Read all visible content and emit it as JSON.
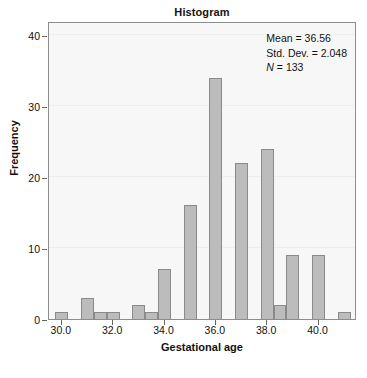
{
  "chart_data": {
    "type": "bar",
    "title": "Histogram",
    "xlabel": "Gestational age",
    "ylabel": "Frequency",
    "xlim": [
      29.5,
      41.5
    ],
    "ylim": [
      0,
      42
    ],
    "bin_width": 0.5,
    "grid": false,
    "legend": "none",
    "x_ticks": [
      "30.0",
      "32.0",
      "34.0",
      "36.0",
      "38.0",
      "40.0"
    ],
    "x_tick_values": [
      30.0,
      32.0,
      34.0,
      36.0,
      38.0,
      40.0
    ],
    "y_ticks": [
      "0",
      "10",
      "20",
      "30",
      "40"
    ],
    "y_tick_values": [
      0,
      10,
      20,
      30,
      40
    ],
    "bins": [
      {
        "center": 30.0,
        "left": 29.75,
        "right": 30.25,
        "value": 1
      },
      {
        "center": 30.5,
        "left": 30.25,
        "right": 30.75,
        "value": 0
      },
      {
        "center": 31.0,
        "left": 30.75,
        "right": 31.25,
        "value": 3
      },
      {
        "center": 31.5,
        "left": 31.25,
        "right": 31.75,
        "value": 1
      },
      {
        "center": 32.0,
        "left": 31.75,
        "right": 32.25,
        "value": 1
      },
      {
        "center": 32.5,
        "left": 32.25,
        "right": 32.75,
        "value": 0
      },
      {
        "center": 33.0,
        "left": 32.75,
        "right": 33.25,
        "value": 2
      },
      {
        "center": 33.5,
        "left": 33.25,
        "right": 33.75,
        "value": 1
      },
      {
        "center": 34.0,
        "left": 33.75,
        "right": 34.25,
        "value": 7
      },
      {
        "center": 34.5,
        "left": 34.25,
        "right": 34.75,
        "value": 0
      },
      {
        "center": 35.0,
        "left": 34.75,
        "right": 35.25,
        "value": 16
      },
      {
        "center": 35.5,
        "left": 35.25,
        "right": 35.75,
        "value": 0
      },
      {
        "center": 36.0,
        "left": 35.75,
        "right": 36.25,
        "value": 34
      },
      {
        "center": 36.5,
        "left": 36.25,
        "right": 36.75,
        "value": 0
      },
      {
        "center": 37.0,
        "left": 36.75,
        "right": 37.25,
        "value": 22
      },
      {
        "center": 37.5,
        "left": 37.25,
        "right": 37.75,
        "value": 0
      },
      {
        "center": 38.0,
        "left": 37.75,
        "right": 38.25,
        "value": 24
      },
      {
        "center": 38.5,
        "left": 38.25,
        "right": 38.75,
        "value": 2
      },
      {
        "center": 39.0,
        "left": 38.75,
        "right": 39.25,
        "value": 9
      },
      {
        "center": 39.5,
        "left": 39.25,
        "right": 39.75,
        "value": 0
      },
      {
        "center": 40.0,
        "left": 39.75,
        "right": 40.25,
        "value": 9
      },
      {
        "center": 40.5,
        "left": 40.25,
        "right": 40.75,
        "value": 0
      },
      {
        "center": 41.0,
        "left": 40.75,
        "right": 41.25,
        "value": 1
      }
    ],
    "annotations": {
      "mean_label": "Mean = 36.56",
      "std_dev_label": "Std. Dev. = 2.048",
      "n_label_prefix": "N",
      "n_label_suffix": " = 133",
      "mean": 36.56,
      "std_dev": 2.048,
      "n": 133
    },
    "colors": {
      "bar_fill": "#bcbcbc",
      "bar_edge": "#8a8a8a",
      "plot_background": "#f7f7f7",
      "frame": "#8d8d8d",
      "text": "#111111"
    }
  }
}
